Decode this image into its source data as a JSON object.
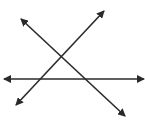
{
  "diagram": {
    "stroke_color": "#2a2a2a",
    "background": "#ffffff",
    "lines": [
      {
        "name": "horizontal-line",
        "x1": 4,
        "y1": 79,
        "x2": 144,
        "y2": 79
      },
      {
        "name": "rising-line",
        "x1": 16,
        "y1": 105,
        "x2": 104,
        "y2": 11
      },
      {
        "name": "falling-line",
        "x1": 21,
        "y1": 19,
        "x2": 125,
        "y2": 116
      }
    ]
  }
}
